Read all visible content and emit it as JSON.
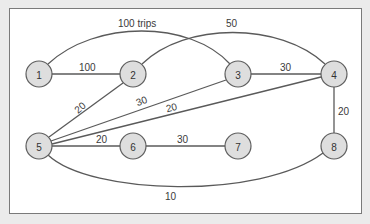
{
  "diagram": {
    "type": "weighted-undirected-graph",
    "nodes": [
      {
        "id": "1",
        "label": "1",
        "x": 39,
        "y": 74
      },
      {
        "id": "2",
        "label": "2",
        "x": 133,
        "y": 74
      },
      {
        "id": "3",
        "label": "3",
        "x": 238,
        "y": 74
      },
      {
        "id": "4",
        "label": "4",
        "x": 334,
        "y": 74
      },
      {
        "id": "5",
        "label": "5",
        "x": 39,
        "y": 146
      },
      {
        "id": "6",
        "label": "6",
        "x": 133,
        "y": 146
      },
      {
        "id": "7",
        "label": "7",
        "x": 238,
        "y": 146
      },
      {
        "id": "8",
        "label": "8",
        "x": 334,
        "y": 146
      }
    ],
    "edges": [
      {
        "from": "1",
        "to": "3",
        "label": "100 trips"
      },
      {
        "from": "1",
        "to": "2",
        "label": "100"
      },
      {
        "from": "2",
        "to": "4",
        "label": "50"
      },
      {
        "from": "3",
        "to": "4",
        "label": "30"
      },
      {
        "from": "2",
        "to": "5",
        "label": "20"
      },
      {
        "from": "3",
        "to": "5",
        "label": "30"
      },
      {
        "from": "4",
        "to": "5",
        "label": "20"
      },
      {
        "from": "4",
        "to": "8",
        "label": "20"
      },
      {
        "from": "5",
        "to": "6",
        "label": "20"
      },
      {
        "from": "6",
        "to": "7",
        "label": "30"
      },
      {
        "from": "5",
        "to": "8",
        "label": "10"
      }
    ]
  }
}
